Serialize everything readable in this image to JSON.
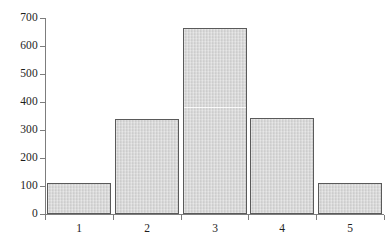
{
  "chart_data": {
    "type": "bar",
    "title": "",
    "subtitle": "",
    "xlabel": "",
    "ylabel": "",
    "categories": [
      "1",
      "2",
      "3",
      "4",
      "5"
    ],
    "values": [
      111,
      339,
      664,
      343,
      112
    ],
    "series": [
      {
        "name": "frequency",
        "values": [
          111,
          339,
          664,
          343,
          112
        ]
      }
    ],
    "ylim": [
      0,
      700
    ],
    "y_ticks": [
      0,
      100,
      200,
      300,
      400,
      500,
      600,
      700
    ],
    "y_tick_labels": [
      "0",
      "100",
      "200",
      "300",
      "400",
      "500",
      "600",
      "700"
    ],
    "x_tick_labels": [
      "1",
      "2",
      "3",
      "4",
      "5"
    ],
    "grid": false,
    "legend": false,
    "legend_position": "none",
    "annotations": [],
    "colors": {
      "bar_fill": "#d2d2d2",
      "bar_border": "#5a5a5a",
      "axis": "#7d7d7d",
      "text": "#1d1d1d",
      "background": "#ffffff"
    }
  }
}
